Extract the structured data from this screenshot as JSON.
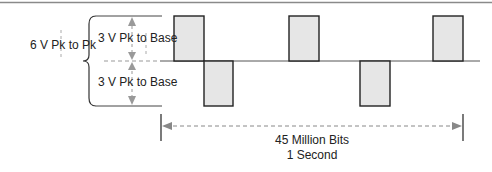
{
  "diagram": {
    "labels": {
      "peak_to_peak": "6 V Pk to Pk",
      "upper_amplitude": "3 V Pk to Base",
      "lower_amplitude": "3 V Pk to Base",
      "bits": "45 Million Bits",
      "time": "1 Second"
    },
    "pulses": [
      {
        "x": 174,
        "w": 30,
        "polarity": "positive"
      },
      {
        "x": 204,
        "w": 29,
        "polarity": "negative"
      },
      {
        "x": 289,
        "w": 30,
        "polarity": "positive"
      },
      {
        "x": 360,
        "w": 30,
        "polarity": "negative"
      },
      {
        "x": 433,
        "w": 30,
        "polarity": "positive"
      }
    ],
    "colors": {
      "pulse_fill": "#e6e6e6",
      "pulse_stroke": "#222222",
      "guide": "#999999",
      "rule": "#8a8a8a"
    }
  }
}
